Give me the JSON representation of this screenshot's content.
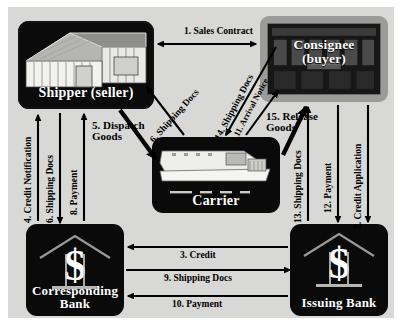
{
  "diagram": {
    "background_color": "#d8d8d6",
    "node_color": "#0a0a0a",
    "consignee_frame_color": "#9b9b99"
  },
  "nodes": [
    {
      "id": "shipper",
      "label": "Shipper (seller)",
      "icon": "warehouse-icon"
    },
    {
      "id": "consignee",
      "label_line1": "Consignee",
      "label_line2": "(buyer)",
      "icon": "office-building-icon"
    },
    {
      "id": "carrier",
      "label": "Carrier",
      "icon": "cargo-ship-icon"
    },
    {
      "id": "corresponding_bank",
      "label_line1": "Corresponding",
      "label_line2": "Bank",
      "icon": "bank-dollar-icon"
    },
    {
      "id": "issuing_bank",
      "label": "Issuing Bank",
      "icon": "bank-dollar-icon"
    }
  ],
  "flows": [
    {
      "step": 1,
      "label": "1. Sales Contract",
      "from": "shipper",
      "to": "consignee",
      "direction": "both"
    },
    {
      "step": 2,
      "label": "2. Credit Application",
      "from": "consignee",
      "to": "issuing_bank",
      "direction": "down"
    },
    {
      "step": 3,
      "label": "3. Credit",
      "from": "issuing_bank",
      "to": "corresponding_bank",
      "direction": "left"
    },
    {
      "step": 4,
      "label": "4. Credit Notification",
      "from": "corresponding_bank",
      "to": "shipper",
      "direction": "up"
    },
    {
      "step": 5,
      "label": "5. Dispatch Goods",
      "from": "shipper",
      "to": "carrier",
      "direction": "down-right"
    },
    {
      "step": 6,
      "label": "6. Shipping Docs",
      "from": "carrier",
      "to": "shipper",
      "direction": "up-left"
    },
    {
      "step": 7,
      "label": "7. Shipping Docs",
      "from": "shipper",
      "to": "corresponding_bank",
      "direction": "down"
    },
    {
      "step": 8,
      "label": "8. Payment",
      "from": "corresponding_bank",
      "to": "shipper",
      "direction": "up"
    },
    {
      "step": 9,
      "label": "9. Shipping Docs",
      "from": "corresponding_bank",
      "to": "issuing_bank",
      "direction": "right"
    },
    {
      "step": 10,
      "label": "10. Payment",
      "from": "issuing_bank",
      "to": "corresponding_bank",
      "direction": "left"
    },
    {
      "step": 11,
      "label": "11. Arrival Notice",
      "from": "carrier",
      "to": "consignee",
      "direction": "up-right"
    },
    {
      "step": 12,
      "label": "12. Payment",
      "from": "consignee",
      "to": "issuing_bank",
      "direction": "down"
    },
    {
      "step": 13,
      "label": "13. Shipping Docs",
      "from": "issuing_bank",
      "to": "consignee",
      "direction": "up"
    },
    {
      "step": 14,
      "label": "14. Shipping Docs",
      "from": "consignee",
      "to": "carrier",
      "direction": "down-left"
    },
    {
      "step": 15,
      "label": "15. Release Goods",
      "from": "carrier",
      "to": "consignee",
      "direction": "up-right"
    }
  ]
}
